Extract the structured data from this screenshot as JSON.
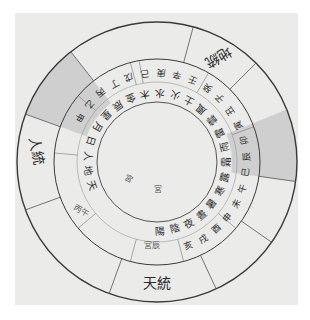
{
  "diagram": {
    "type": "circular cosmological wheel (scanned manuscript)",
    "center": [
      157,
      162
    ],
    "rings": {
      "outer_radius": 140,
      "middle_radius": 103,
      "inner_radius": 60
    },
    "colors": {
      "paper": "#ebebea",
      "line": "#3a3a3a",
      "shade": "#cfcfcf",
      "ink": "#2a2a2a"
    },
    "outer_labels": [
      {
        "text": "地統",
        "angle": -60,
        "rotate": 150
      },
      {
        "text": "天統",
        "angle": 90,
        "rotate": 0
      },
      {
        "text": "人統",
        "angle": 185,
        "rotate": 80
      }
    ],
    "small_labels": [
      {
        "text": "宮辰",
        "x": 152,
        "y": 248,
        "rotate": 0
      },
      {
        "text": "丙午",
        "x": 80,
        "y": 213,
        "rotate": 30
      },
      {
        "text": "宮",
        "x": 158,
        "y": 192,
        "rotate": 0
      },
      {
        "text": "宮",
        "x": 127,
        "y": 181,
        "rotate": 30
      }
    ],
    "middle_ring_text": "甲乙丙丁戊己庚辛壬癸子丑寅卯辰巳午未申酉戌亥",
    "inner_ring_text": "天地人日月星辰金木水火土風雲雷雨霜露寒暑晝夜陰陽",
    "shaded_sectors": [
      {
        "start": 200,
        "end": 232
      },
      {
        "start": -22,
        "end": 8
      }
    ]
  }
}
